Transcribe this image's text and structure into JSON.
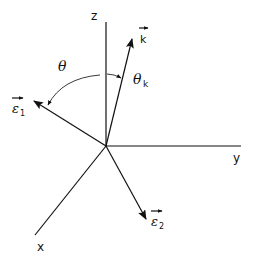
{
  "figure": {
    "type": "3d-coordinate-vector-diagram",
    "axes": {
      "x": {
        "label": "x"
      },
      "y": {
        "label": "y"
      },
      "z": {
        "label": "z"
      }
    },
    "vectors": {
      "k": {
        "label": "k",
        "vector_mark": "→"
      },
      "epsilon1": {
        "label": "ε",
        "subscript": "1",
        "vector_mark": "→"
      },
      "epsilon2": {
        "label": "ε",
        "subscript": "2",
        "vector_mark": "→"
      }
    },
    "angles": {
      "theta": {
        "label": "θ"
      },
      "theta_k": {
        "label": "θ",
        "subscript": "k"
      }
    },
    "colors": {
      "ink": "#111111",
      "background": "#ffffff"
    }
  }
}
